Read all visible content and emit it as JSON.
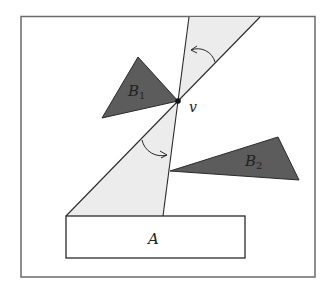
{
  "diagram": {
    "labels": {
      "block_a": "A",
      "obstacle_b1": "B",
      "obstacle_b1_sub": "1",
      "obstacle_b2": "B",
      "obstacle_b2_sub": "2",
      "vertex": "v"
    },
    "colors": {
      "frame": "#6a6a6a",
      "obstacle_fill": "#5c5c5c",
      "wedge_fill": "#ececec",
      "line": "#2a2a2a"
    }
  }
}
